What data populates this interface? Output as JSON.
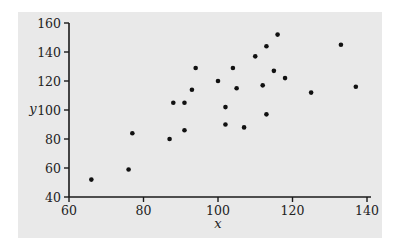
{
  "colors": {
    "background": "#ffffff",
    "panel": "#e9e9e9",
    "axis": "#1a1a1a",
    "point": "#111111",
    "text": "#222222"
  },
  "chart_data": {
    "type": "scatter",
    "title": "",
    "xlabel": "x",
    "ylabel": "y",
    "xlim": [
      60,
      140
    ],
    "ylim": [
      40,
      160
    ],
    "xticks": [
      60,
      80,
      100,
      120,
      140
    ],
    "yticks": [
      40,
      60,
      80,
      100,
      120,
      140,
      160
    ],
    "grid": false,
    "legend": null,
    "series": [
      {
        "name": "data",
        "points": [
          {
            "x": 66,
            "y": 52
          },
          {
            "x": 76,
            "y": 59
          },
          {
            "x": 77,
            "y": 84
          },
          {
            "x": 87,
            "y": 80
          },
          {
            "x": 88,
            "y": 105
          },
          {
            "x": 91,
            "y": 86
          },
          {
            "x": 91,
            "y": 105
          },
          {
            "x": 93,
            "y": 114
          },
          {
            "x": 94,
            "y": 129
          },
          {
            "x": 100,
            "y": 120
          },
          {
            "x": 102,
            "y": 102
          },
          {
            "x": 102,
            "y": 90
          },
          {
            "x": 104,
            "y": 129
          },
          {
            "x": 105,
            "y": 115
          },
          {
            "x": 107,
            "y": 88
          },
          {
            "x": 110,
            "y": 137
          },
          {
            "x": 112,
            "y": 117
          },
          {
            "x": 113,
            "y": 97
          },
          {
            "x": 113,
            "y": 144
          },
          {
            "x": 115,
            "y": 127
          },
          {
            "x": 116,
            "y": 152
          },
          {
            "x": 118,
            "y": 122
          },
          {
            "x": 125,
            "y": 112
          },
          {
            "x": 133,
            "y": 145
          },
          {
            "x": 137,
            "y": 116
          }
        ]
      }
    ]
  }
}
